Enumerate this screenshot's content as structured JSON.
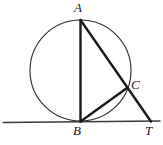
{
  "figure": {
    "width": 163,
    "height": 145,
    "background_color": "#ffffff",
    "stroke_color": "#1a1a1a",
    "circle_stroke_color": "#2b2b2b",
    "tangent_stroke_color": "#3a3a3a"
  },
  "labels": {
    "A": "A",
    "B": "B",
    "C": "C",
    "T": "T"
  },
  "geometry": {
    "circle": {
      "cx": 80.5,
      "cy": 70.5,
      "r": 50.5,
      "stroke_width": 1.1
    },
    "points": {
      "A": {
        "x": 80.5,
        "y": 20.0
      },
      "B": {
        "x": 80.5,
        "y": 121.5
      },
      "C": {
        "x": 127.0,
        "y": 88.0
      },
      "T": {
        "x": 151.0,
        "y": 121.5
      }
    },
    "segments": [
      {
        "name": "diameter-AB",
        "from": "A",
        "to": "B",
        "stroke_width": 2.4
      },
      {
        "name": "secant-AT",
        "from": "A",
        "to": "T",
        "stroke_width": 2.4
      },
      {
        "name": "chord-BC",
        "from": "B",
        "to": "C",
        "stroke_width": 2.4
      }
    ],
    "tangent_line": {
      "name": "tangent-at-B",
      "x1": 3.0,
      "y1": 122.5,
      "x2": 160.0,
      "y2": 121.0,
      "stroke_width": 1.4
    }
  }
}
